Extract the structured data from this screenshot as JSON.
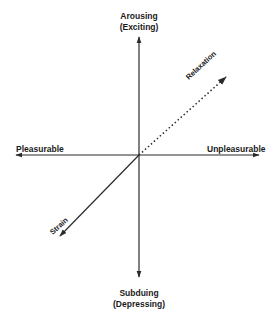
{
  "diagram": {
    "type": "axes-diagram",
    "axes": {
      "vertical": {
        "top_label_line1": "Arousing",
        "top_label_line2": "(Exciting)",
        "bottom_label_line1": "Subduing",
        "bottom_label_line2": "(Depressing)"
      },
      "horizontal": {
        "left_label": "Pleasurable",
        "right_label": "Unpleasurable"
      }
    },
    "diagonals": [
      {
        "label": "Relaxation",
        "direction": "up-right",
        "style": "dotted"
      },
      {
        "label": "Strain",
        "direction": "down-left",
        "style": "solid"
      }
    ],
    "colors": {
      "line": "#2a2a2a",
      "text": "#1a1a1a",
      "background": "#ffffff"
    }
  }
}
